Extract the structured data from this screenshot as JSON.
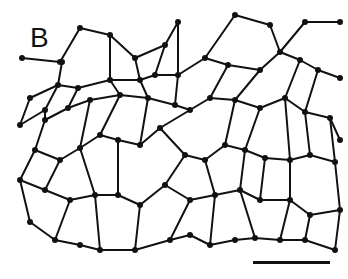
{
  "figure": {
    "panel_label": "B",
    "colors": {
      "background": "#ffffff",
      "edges": "#111111"
    },
    "scale_bar": {
      "x1": 253,
      "x2": 330,
      "y": 262,
      "label": ""
    },
    "nodes": [
      [
        60,
        62
      ],
      [
        80,
        28
      ],
      [
        110,
        35
      ],
      [
        135,
        58
      ],
      [
        165,
        45
      ],
      [
        178,
        22
      ],
      [
        235,
        15
      ],
      [
        270,
        25
      ],
      [
        305,
        22
      ],
      [
        340,
        22
      ],
      [
        22,
        58
      ],
      [
        62,
        62
      ],
      [
        58,
        85
      ],
      [
        30,
        98
      ],
      [
        20,
        125
      ],
      [
        45,
        110
      ],
      [
        78,
        88
      ],
      [
        110,
        80
      ],
      [
        140,
        80
      ],
      [
        155,
        75
      ],
      [
        178,
        75
      ],
      [
        205,
        58
      ],
      [
        228,
        65
      ],
      [
        260,
        70
      ],
      [
        280,
        52
      ],
      [
        300,
        60
      ],
      [
        318,
        70
      ],
      [
        340,
        78
      ],
      [
        45,
        120
      ],
      [
        68,
        108
      ],
      [
        90,
        100
      ],
      [
        120,
        95
      ],
      [
        148,
        98
      ],
      [
        175,
        105
      ],
      [
        190,
        110
      ],
      [
        210,
        98
      ],
      [
        235,
        100
      ],
      [
        260,
        108
      ],
      [
        285,
        98
      ],
      [
        305,
        112
      ],
      [
        330,
        118
      ],
      [
        340,
        140
      ],
      [
        35,
        150
      ],
      [
        60,
        160
      ],
      [
        80,
        148
      ],
      [
        100,
        135
      ],
      [
        118,
        140
      ],
      [
        140,
        145
      ],
      [
        160,
        128
      ],
      [
        185,
        155
      ],
      [
        205,
        160
      ],
      [
        225,
        145
      ],
      [
        245,
        150
      ],
      [
        265,
        158
      ],
      [
        290,
        160
      ],
      [
        310,
        155
      ],
      [
        335,
        162
      ],
      [
        20,
        180
      ],
      [
        45,
        190
      ],
      [
        70,
        200
      ],
      [
        95,
        195
      ],
      [
        118,
        195
      ],
      [
        140,
        205
      ],
      [
        165,
        185
      ],
      [
        190,
        200
      ],
      [
        215,
        195
      ],
      [
        240,
        190
      ],
      [
        260,
        200
      ],
      [
        290,
        200
      ],
      [
        310,
        215
      ],
      [
        340,
        210
      ],
      [
        30,
        222
      ],
      [
        55,
        240
      ],
      [
        80,
        245
      ],
      [
        100,
        250
      ],
      [
        135,
        250
      ],
      [
        170,
        240
      ],
      [
        190,
        235
      ],
      [
        210,
        245
      ],
      [
        235,
        240
      ],
      [
        255,
        238
      ],
      [
        280,
        240
      ],
      [
        305,
        240
      ],
      [
        335,
        250
      ]
    ],
    "edges": [
      [
        0,
        1
      ],
      [
        1,
        2
      ],
      [
        2,
        3
      ],
      [
        3,
        4
      ],
      [
        4,
        5
      ],
      [
        2,
        17
      ],
      [
        3,
        18
      ],
      [
        4,
        19
      ],
      [
        5,
        20
      ],
      [
        6,
        21
      ],
      [
        6,
        7
      ],
      [
        7,
        24
      ],
      [
        8,
        24
      ],
      [
        8,
        9
      ],
      [
        10,
        0
      ],
      [
        0,
        11
      ],
      [
        11,
        12
      ],
      [
        12,
        13
      ],
      [
        13,
        14
      ],
      [
        14,
        15
      ],
      [
        15,
        12
      ],
      [
        12,
        16
      ],
      [
        16,
        17
      ],
      [
        17,
        18
      ],
      [
        18,
        19
      ],
      [
        19,
        20
      ],
      [
        20,
        21
      ],
      [
        21,
        22
      ],
      [
        22,
        23
      ],
      [
        23,
        24
      ],
      [
        24,
        25
      ],
      [
        25,
        26
      ],
      [
        26,
        27
      ],
      [
        15,
        28
      ],
      [
        28,
        29
      ],
      [
        29,
        16
      ],
      [
        29,
        30
      ],
      [
        30,
        31
      ],
      [
        31,
        17
      ],
      [
        31,
        32
      ],
      [
        32,
        18
      ],
      [
        32,
        33
      ],
      [
        33,
        20
      ],
      [
        33,
        34
      ],
      [
        34,
        35
      ],
      [
        35,
        22
      ],
      [
        35,
        36
      ],
      [
        36,
        23
      ],
      [
        36,
        37
      ],
      [
        37,
        38
      ],
      [
        38,
        25
      ],
      [
        38,
        39
      ],
      [
        39,
        26
      ],
      [
        39,
        40
      ],
      [
        40,
        41
      ],
      [
        28,
        42
      ],
      [
        42,
        43
      ],
      [
        43,
        44
      ],
      [
        44,
        30
      ],
      [
        44,
        45
      ],
      [
        45,
        31
      ],
      [
        45,
        46
      ],
      [
        46,
        47
      ],
      [
        47,
        32
      ],
      [
        47,
        48
      ],
      [
        48,
        34
      ],
      [
        48,
        49
      ],
      [
        49,
        50
      ],
      [
        50,
        51
      ],
      [
        51,
        36
      ],
      [
        51,
        52
      ],
      [
        52,
        37
      ],
      [
        52,
        53
      ],
      [
        53,
        54
      ],
      [
        54,
        38
      ],
      [
        54,
        55
      ],
      [
        55,
        39
      ],
      [
        55,
        56
      ],
      [
        56,
        40
      ],
      [
        42,
        57
      ],
      [
        57,
        58
      ],
      [
        58,
        43
      ],
      [
        58,
        59
      ],
      [
        59,
        60
      ],
      [
        60,
        44
      ],
      [
        60,
        61
      ],
      [
        61,
        46
      ],
      [
        61,
        62
      ],
      [
        62,
        63
      ],
      [
        63,
        49
      ],
      [
        63,
        64
      ],
      [
        64,
        65
      ],
      [
        65,
        50
      ],
      [
        65,
        66
      ],
      [
        66,
        52
      ],
      [
        66,
        67
      ],
      [
        67,
        53
      ],
      [
        67,
        68
      ],
      [
        68,
        54
      ],
      [
        68,
        69
      ],
      [
        69,
        70
      ],
      [
        70,
        56
      ],
      [
        57,
        71
      ],
      [
        71,
        72
      ],
      [
        72,
        59
      ],
      [
        72,
        73
      ],
      [
        73,
        74
      ],
      [
        74,
        60
      ],
      [
        74,
        75
      ],
      [
        75,
        62
      ],
      [
        75,
        76
      ],
      [
        76,
        64
      ],
      [
        76,
        77
      ],
      [
        77,
        78
      ],
      [
        78,
        65
      ],
      [
        78,
        79
      ],
      [
        79,
        80
      ],
      [
        80,
        66
      ],
      [
        80,
        81
      ],
      [
        81,
        68
      ],
      [
        81,
        82
      ],
      [
        82,
        69
      ],
      [
        82,
        83
      ],
      [
        83,
        70
      ]
    ]
  }
}
